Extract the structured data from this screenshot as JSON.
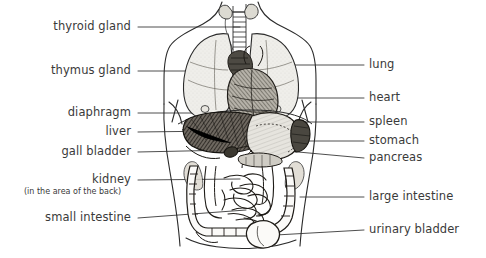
{
  "figure": {
    "background_color": "#ffffff",
    "ink_color": "#2b2b2b",
    "text_color": "#3a3a3a",
    "width": 486,
    "height": 258
  },
  "labels": {
    "left": [
      {
        "text": "thyroid gland",
        "x_right": 131,
        "y": 27
      },
      {
        "text": "thymus gland",
        "x_right": 131,
        "y": 71
      },
      {
        "text": "diaphragm",
        "x_right": 131,
        "y": 113
      },
      {
        "text": "liver",
        "x_right": 131,
        "y": 132
      },
      {
        "text": "gall bladder",
        "x_right": 131,
        "y": 152
      },
      {
        "text": "kidney",
        "x_right": 131,
        "y": 180
      },
      {
        "text": "small intestine",
        "x_right": 131,
        "y": 218
      }
    ],
    "left_sub": [
      {
        "text": "(in the area of the back)",
        "x_center": 91,
        "y": 192
      }
    ],
    "right": [
      {
        "text": "lung",
        "x_left": 369,
        "y": 65
      },
      {
        "text": "heart",
        "x_left": 369,
        "y": 98
      },
      {
        "text": "spleen",
        "x_left": 369,
        "y": 122
      },
      {
        "text": "stomach",
        "x_left": 369,
        "y": 141
      },
      {
        "text": "pancreas",
        "x_left": 369,
        "y": 158
      },
      {
        "text": "large intestine",
        "x_left": 369,
        "y": 197
      },
      {
        "text": "urinary bladder",
        "x_left": 369,
        "y": 230
      }
    ]
  },
  "organs": [
    {
      "name": "thyroid-gland"
    },
    {
      "name": "thymus-gland"
    },
    {
      "name": "diaphragm"
    },
    {
      "name": "liver"
    },
    {
      "name": "gall-bladder"
    },
    {
      "name": "kidney"
    },
    {
      "name": "small-intestine"
    },
    {
      "name": "lung"
    },
    {
      "name": "heart"
    },
    {
      "name": "spleen"
    },
    {
      "name": "stomach"
    },
    {
      "name": "pancreas"
    },
    {
      "name": "large-intestine"
    },
    {
      "name": "urinary-bladder"
    },
    {
      "name": "trachea"
    }
  ]
}
